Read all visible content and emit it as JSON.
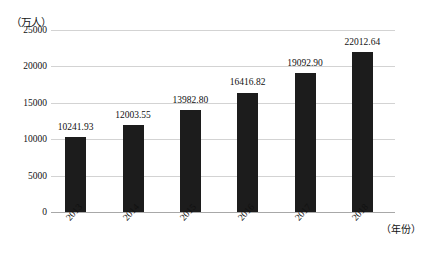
{
  "chart_data": {
    "type": "bar",
    "title": "",
    "xlabel": "（年份）",
    "ylabel": "（万人）",
    "categories": [
      "2013",
      "2014",
      "2015",
      "2016",
      "2017",
      "2018"
    ],
    "values": [
      10241.93,
      12003.55,
      13982.8,
      16416.82,
      19092.9,
      22012.64
    ],
    "value_labels": [
      "10241.93",
      "12003.55",
      "13982.80",
      "16416.82",
      "19092.90",
      "22012.64"
    ],
    "ylim": [
      0,
      25000
    ],
    "yticks": [
      0,
      5000,
      10000,
      15000,
      20000,
      25000
    ],
    "ytick_labels": [
      "0",
      "5000",
      "10000",
      "15000",
      "20000",
      "25000"
    ],
    "grid": true,
    "legend": null,
    "series": [
      {
        "name": "",
        "values": [
          10241.93,
          12003.55,
          13982.8,
          16416.82,
          19092.9,
          22012.64
        ]
      }
    ],
    "colors": {
      "bar": "#1c1c1c",
      "gridline": "#d3d3d3",
      "axis": "#a8a8a8",
      "text": "#111111",
      "background": "#ffffff"
    }
  }
}
